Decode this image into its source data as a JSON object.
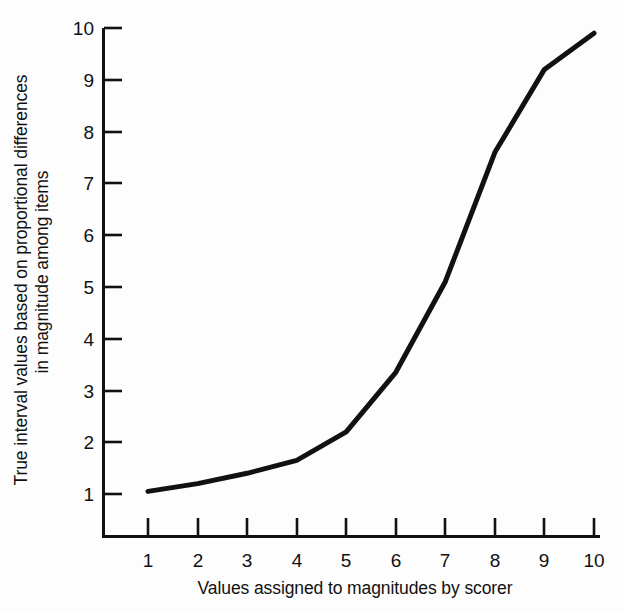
{
  "chart_data": {
    "type": "line",
    "title": "",
    "xlabel": "Values assigned to magnitudes by scorer",
    "ylabel": "True interval values based on proportional differences in magnitude among items",
    "ylabel_lines": [
      "True interval values based on proportional differences",
      "in magnitude among items"
    ],
    "x": [
      1,
      2,
      3,
      4,
      5,
      6,
      7,
      8,
      9,
      10
    ],
    "values": [
      1.05,
      1.2,
      1.4,
      1.65,
      2.2,
      3.35,
      5.1,
      7.6,
      9.2,
      9.9
    ],
    "series": [
      {
        "name": "True interval value",
        "values": [
          1.05,
          1.2,
          1.4,
          1.65,
          2.2,
          3.35,
          5.1,
          7.6,
          9.2,
          9.9
        ]
      }
    ],
    "xlim": [
      1,
      10
    ],
    "ylim": [
      0,
      10
    ],
    "xticks": [
      1,
      2,
      3,
      4,
      5,
      6,
      7,
      8,
      9,
      10
    ],
    "yticks": [
      1,
      2,
      3,
      4,
      5,
      6,
      7,
      8,
      9,
      10
    ],
    "xtick_labels": [
      "1",
      "2",
      "3",
      "4",
      "5",
      "6",
      "7",
      "8",
      "9",
      "10"
    ],
    "ytick_labels": [
      "1",
      "2",
      "3",
      "4",
      "5",
      "6",
      "7",
      "8",
      "9",
      "10"
    ],
    "grid": false,
    "legend": null,
    "line_color": "#111111",
    "line_width": 5,
    "axis_color": "#111111",
    "background_color": "#fdfdfd"
  }
}
